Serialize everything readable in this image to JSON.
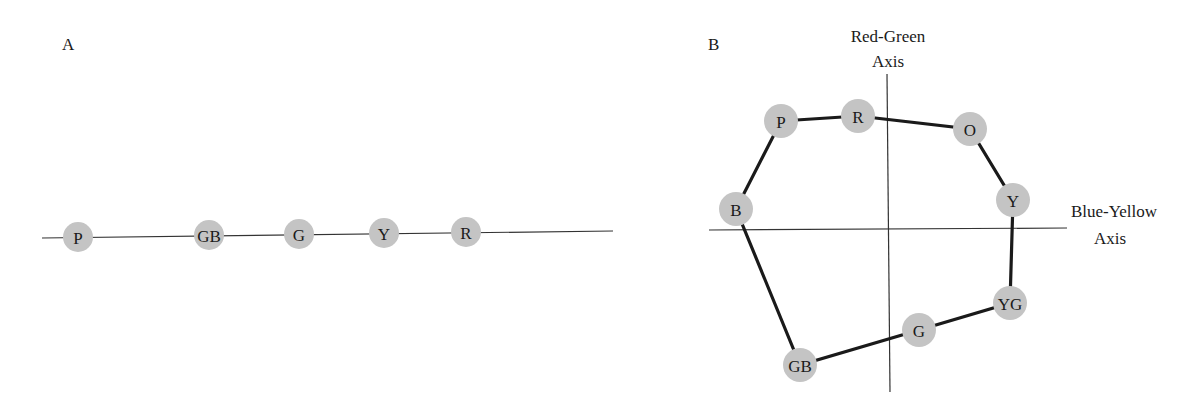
{
  "panel_a": {
    "label": "A",
    "line": {
      "x1": 42,
      "y1": 238,
      "x2": 613,
      "y2": 231
    },
    "nodes": [
      {
        "label": "P",
        "x": 78,
        "y": 237
      },
      {
        "label": "GB",
        "x": 209,
        "y": 235
      },
      {
        "label": "G",
        "x": 299,
        "y": 234
      },
      {
        "label": "Y",
        "x": 384,
        "y": 233
      },
      {
        "label": "R",
        "x": 466,
        "y": 232
      }
    ]
  },
  "panel_b": {
    "label": "B",
    "vertical_axis": {
      "label_line1": "Red-Green",
      "label_line2": "Axis",
      "x1": 887,
      "y1": 74,
      "x2": 890,
      "y2": 392
    },
    "horizontal_axis": {
      "label_line1": "Blue-Yellow",
      "label_line2": "Axis",
      "x1": 709,
      "y1": 230,
      "x2": 1067,
      "y2": 228
    },
    "nodes": [
      {
        "label": "P",
        "x": 781,
        "y": 121
      },
      {
        "label": "R",
        "x": 858,
        "y": 116
      },
      {
        "label": "O",
        "x": 970,
        "y": 129
      },
      {
        "label": "Y",
        "x": 1013,
        "y": 200
      },
      {
        "label": "YG",
        "x": 1010,
        "y": 303
      },
      {
        "label": "G",
        "x": 919,
        "y": 330
      },
      {
        "label": "GB",
        "x": 800,
        "y": 365
      },
      {
        "label": "B",
        "x": 736,
        "y": 209
      }
    ],
    "ring_order": [
      "P",
      "R",
      "O",
      "Y",
      "YG",
      "G",
      "GB",
      "B"
    ]
  },
  "colors": {
    "node_fill": "#c4c4c4",
    "line": "#1a1a1a"
  }
}
